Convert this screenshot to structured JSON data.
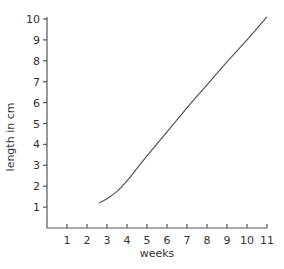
{
  "chart_data": {
    "type": "line",
    "title": "",
    "xlabel": "weeks",
    "ylabel": "length in cm",
    "xlim": [
      0,
      11
    ],
    "ylim": [
      0,
      10
    ],
    "x_ticks": [
      1,
      2,
      3,
      4,
      5,
      6,
      7,
      8,
      9,
      10,
      11
    ],
    "y_ticks": [
      1,
      2,
      3,
      4,
      5,
      6,
      7,
      8,
      9,
      10
    ],
    "grid": false,
    "legend": null,
    "series": [
      {
        "name": "length",
        "x": [
          2.6,
          3.0,
          3.5,
          4.0,
          4.5,
          5.0,
          6.0,
          7.0,
          8.0,
          9.0,
          10.0,
          11.0
        ],
        "y": [
          1.2,
          1.4,
          1.75,
          2.25,
          2.85,
          3.45,
          4.6,
          5.75,
          6.85,
          7.95,
          9.0,
          10.1
        ]
      }
    ]
  },
  "colors": {
    "axis": "#555555",
    "line": "#555555",
    "text": "#333333",
    "background": "#ffffff"
  }
}
